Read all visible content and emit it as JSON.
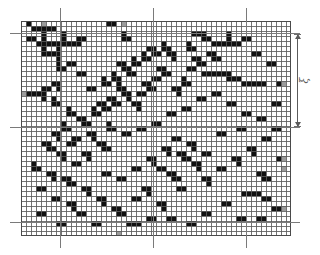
{
  "figure": {
    "type": "percolation-lattice-diagram",
    "background_color": "#ffffff"
  },
  "lattice": {
    "origin_x": 21,
    "origin_y": 21,
    "cell_size": 5,
    "cols": 54,
    "rows": 43,
    "gridline_color": "#5c5c5c",
    "gridline_width": 0.5,
    "occupied_color": "#111111",
    "grey_color": "#9b9b9b",
    "empty_color": "#ffffff",
    "border_color": "#4a4a4a",
    "occupied_cells": [
      [
        2,
        1
      ],
      [
        3,
        1
      ],
      [
        4,
        1
      ],
      [
        5,
        1
      ],
      [
        6,
        1
      ],
      [
        4,
        2
      ],
      [
        4,
        3
      ],
      [
        3,
        4
      ],
      [
        4,
        4
      ],
      [
        5,
        4
      ],
      [
        6,
        4
      ],
      [
        7,
        4
      ],
      [
        8,
        4
      ],
      [
        9,
        4
      ],
      [
        10,
        4
      ],
      [
        11,
        4
      ],
      [
        8,
        2
      ],
      [
        8,
        3
      ],
      [
        11,
        3
      ],
      [
        12,
        3
      ],
      [
        1,
        3
      ],
      [
        2,
        3
      ],
      [
        4,
        5
      ],
      [
        4,
        6
      ],
      [
        5,
        6
      ],
      [
        6,
        6
      ],
      [
        7,
        6
      ],
      [
        7,
        5
      ],
      [
        7,
        7
      ],
      [
        7,
        8
      ],
      [
        7,
        9
      ],
      [
        8,
        9
      ],
      [
        20,
        2
      ],
      [
        20,
        3
      ],
      [
        21,
        3
      ],
      [
        17,
        0
      ],
      [
        18,
        0
      ],
      [
        1,
        0
      ],
      [
        25,
        5
      ],
      [
        26,
        5
      ],
      [
        26,
        6
      ],
      [
        27,
        6
      ],
      [
        24,
        6
      ],
      [
        24,
        7
      ],
      [
        25,
        7
      ],
      [
        22,
        7
      ],
      [
        22,
        8
      ],
      [
        23,
        8
      ],
      [
        19,
        8
      ],
      [
        20,
        8
      ],
      [
        20,
        9
      ],
      [
        21,
        9
      ],
      [
        21,
        10
      ],
      [
        22,
        10
      ],
      [
        18,
        10
      ],
      [
        18,
        11
      ],
      [
        19,
        11
      ],
      [
        16,
        11
      ],
      [
        16,
        12
      ],
      [
        17,
        12
      ],
      [
        19,
        12
      ],
      [
        19,
        13
      ],
      [
        20,
        13
      ],
      [
        20,
        14
      ],
      [
        21,
        14
      ],
      [
        21,
        15
      ],
      [
        17,
        15
      ],
      [
        18,
        15
      ],
      [
        18,
        16
      ],
      [
        19,
        16
      ],
      [
        15,
        16
      ],
      [
        16,
        16
      ],
      [
        16,
        17
      ],
      [
        17,
        17
      ],
      [
        14,
        17
      ],
      [
        14,
        18
      ],
      [
        15,
        18
      ],
      [
        28,
        4
      ],
      [
        28,
        5
      ],
      [
        29,
        5
      ],
      [
        29,
        6
      ],
      [
        30,
        6
      ],
      [
        30,
        7
      ],
      [
        27,
        9
      ],
      [
        28,
        9
      ],
      [
        28,
        10
      ],
      [
        29,
        10
      ],
      [
        26,
        11
      ],
      [
        27,
        11
      ],
      [
        24,
        12
      ],
      [
        25,
        12
      ],
      [
        25,
        13
      ],
      [
        26,
        13
      ],
      [
        23,
        14
      ],
      [
        24,
        14
      ],
      [
        22,
        16
      ],
      [
        23,
        16
      ],
      [
        23,
        17
      ],
      [
        34,
        2
      ],
      [
        35,
        2
      ],
      [
        36,
        2
      ],
      [
        36,
        3
      ],
      [
        37,
        3
      ],
      [
        33,
        4
      ],
      [
        33,
        5
      ],
      [
        34,
        5
      ],
      [
        38,
        4
      ],
      [
        39,
        4
      ],
      [
        40,
        4
      ],
      [
        41,
        4
      ],
      [
        42,
        4
      ],
      [
        43,
        4
      ],
      [
        41,
        2
      ],
      [
        41,
        3
      ],
      [
        44,
        3
      ],
      [
        45,
        3
      ],
      [
        37,
        6
      ],
      [
        38,
        6
      ],
      [
        38,
        7
      ],
      [
        39,
        7
      ],
      [
        34,
        7
      ],
      [
        35,
        7
      ],
      [
        35,
        8
      ],
      [
        36,
        8
      ],
      [
        33,
        9
      ],
      [
        34,
        9
      ],
      [
        36,
        10
      ],
      [
        37,
        10
      ],
      [
        38,
        10
      ],
      [
        39,
        10
      ],
      [
        40,
        10
      ],
      [
        41,
        10
      ],
      [
        41,
        11
      ],
      [
        42,
        11
      ],
      [
        43,
        11
      ],
      [
        44,
        12
      ],
      [
        45,
        12
      ],
      [
        46,
        12
      ],
      [
        47,
        12
      ],
      [
        48,
        12
      ],
      [
        32,
        11
      ],
      [
        32,
        12
      ],
      [
        33,
        12
      ],
      [
        30,
        13
      ],
      [
        31,
        13
      ],
      [
        31,
        14
      ],
      [
        6,
        12
      ],
      [
        7,
        12
      ],
      [
        7,
        13
      ],
      [
        4,
        13
      ],
      [
        5,
        13
      ],
      [
        1,
        14
      ],
      [
        2,
        14
      ],
      [
        3,
        14
      ],
      [
        4,
        14
      ],
      [
        4,
        15
      ],
      [
        6,
        15
      ],
      [
        6,
        16
      ],
      [
        7,
        16
      ],
      [
        9,
        17
      ],
      [
        9,
        18
      ],
      [
        10,
        18
      ],
      [
        11,
        19
      ],
      [
        12,
        19
      ],
      [
        12,
        20
      ],
      [
        13,
        20
      ],
      [
        8,
        20
      ],
      [
        8,
        21
      ],
      [
        9,
        21
      ],
      [
        6,
        22
      ],
      [
        7,
        22
      ],
      [
        7,
        23
      ],
      [
        4,
        24
      ],
      [
        5,
        24
      ],
      [
        5,
        25
      ],
      [
        6,
        25
      ],
      [
        7,
        26
      ],
      [
        8,
        26
      ],
      [
        8,
        27
      ],
      [
        9,
        24
      ],
      [
        10,
        24
      ],
      [
        10,
        23
      ],
      [
        11,
        23
      ],
      [
        13,
        22
      ],
      [
        14,
        22
      ],
      [
        14,
        23
      ],
      [
        15,
        24
      ],
      [
        16,
        24
      ],
      [
        16,
        25
      ],
      [
        17,
        25
      ],
      [
        12,
        26
      ],
      [
        13,
        26
      ],
      [
        13,
        27
      ],
      [
        10,
        28
      ],
      [
        11,
        28
      ],
      [
        2,
        28
      ],
      [
        2,
        29
      ],
      [
        3,
        29
      ],
      [
        5,
        30
      ],
      [
        6,
        30
      ],
      [
        6,
        31
      ],
      [
        8,
        31
      ],
      [
        9,
        31
      ],
      [
        9,
        32
      ],
      [
        10,
        32
      ],
      [
        12,
        33
      ],
      [
        13,
        33
      ],
      [
        13,
        34
      ],
      [
        15,
        35
      ],
      [
        16,
        35
      ],
      [
        16,
        36
      ],
      [
        18,
        37
      ],
      [
        19,
        37
      ],
      [
        19,
        38
      ],
      [
        20,
        38
      ],
      [
        9,
        36
      ],
      [
        10,
        36
      ],
      [
        10,
        37
      ],
      [
        6,
        35
      ],
      [
        7,
        35
      ],
      [
        3,
        33
      ],
      [
        4,
        33
      ],
      [
        24,
        33
      ],
      [
        25,
        33
      ],
      [
        25,
        34
      ],
      [
        22,
        35
      ],
      [
        23,
        35
      ],
      [
        27,
        36
      ],
      [
        28,
        36
      ],
      [
        28,
        37
      ],
      [
        31,
        33
      ],
      [
        32,
        33
      ],
      [
        29,
        30
      ],
      [
        30,
        30
      ],
      [
        30,
        31
      ],
      [
        31,
        31
      ],
      [
        27,
        29
      ],
      [
        28,
        29
      ],
      [
        25,
        27
      ],
      [
        26,
        27
      ],
      [
        26,
        28
      ],
      [
        28,
        25
      ],
      [
        29,
        25
      ],
      [
        29,
        26
      ],
      [
        31,
        26
      ],
      [
        32,
        26
      ],
      [
        32,
        27
      ],
      [
        33,
        27
      ],
      [
        34,
        28
      ],
      [
        35,
        28
      ],
      [
        35,
        29
      ],
      [
        36,
        26
      ],
      [
        37,
        26
      ],
      [
        33,
        24
      ],
      [
        34,
        24
      ],
      [
        34,
        25
      ],
      [
        30,
        23
      ],
      [
        31,
        23
      ],
      [
        36,
        31
      ],
      [
        37,
        31
      ],
      [
        37,
        32
      ],
      [
        39,
        29
      ],
      [
        40,
        29
      ],
      [
        42,
        27
      ],
      [
        43,
        27
      ],
      [
        43,
        28
      ],
      [
        45,
        25
      ],
      [
        46,
        25
      ],
      [
        46,
        26
      ],
      [
        48,
        23
      ],
      [
        49,
        23
      ],
      [
        47,
        30
      ],
      [
        48,
        30
      ],
      [
        48,
        31
      ],
      [
        49,
        31
      ],
      [
        44,
        34
      ],
      [
        45,
        34
      ],
      [
        46,
        34
      ],
      [
        47,
        34
      ],
      [
        48,
        35
      ],
      [
        49,
        35
      ],
      [
        40,
        36
      ],
      [
        41,
        36
      ],
      [
        36,
        38
      ],
      [
        37,
        38
      ],
      [
        21,
        40
      ],
      [
        22,
        40
      ],
      [
        23,
        40
      ],
      [
        25,
        39
      ],
      [
        26,
        39
      ],
      [
        14,
        40
      ],
      [
        15,
        40
      ],
      [
        11,
        38
      ],
      [
        12,
        38
      ],
      [
        17,
        20
      ],
      [
        17,
        21
      ],
      [
        18,
        21
      ],
      [
        20,
        22
      ],
      [
        21,
        22
      ],
      [
        23,
        21
      ],
      [
        24,
        21
      ],
      [
        26,
        20
      ],
      [
        27,
        20
      ],
      [
        29,
        18
      ],
      [
        30,
        18
      ],
      [
        32,
        17
      ],
      [
        33,
        17
      ],
      [
        35,
        15
      ],
      [
        36,
        15
      ],
      [
        38,
        14
      ],
      [
        39,
        14
      ],
      [
        41,
        16
      ],
      [
        42,
        16
      ],
      [
        44,
        18
      ],
      [
        45,
        18
      ],
      [
        47,
        19
      ],
      [
        48,
        19
      ],
      [
        50,
        21
      ],
      [
        51,
        21
      ],
      [
        50,
        16
      ],
      [
        51,
        16
      ],
      [
        49,
        8
      ],
      [
        50,
        8
      ],
      [
        46,
        6
      ],
      [
        47,
        6
      ],
      [
        43,
        21
      ],
      [
        44,
        21
      ],
      [
        39,
        22
      ],
      [
        40,
        22
      ],
      [
        16,
        30
      ],
      [
        17,
        30
      ],
      [
        19,
        31
      ],
      [
        20,
        31
      ],
      [
        22,
        29
      ],
      [
        23,
        29
      ],
      [
        13,
        13
      ],
      [
        14,
        13
      ],
      [
        11,
        10
      ],
      [
        12,
        10
      ],
      [
        9,
        8
      ],
      [
        10,
        8
      ],
      [
        29,
        39
      ],
      [
        30,
        39
      ],
      [
        33,
        40
      ],
      [
        34,
        40
      ],
      [
        7,
        40
      ],
      [
        8,
        40
      ],
      [
        3,
        38
      ],
      [
        4,
        38
      ],
      [
        43,
        39
      ],
      [
        44,
        39
      ],
      [
        47,
        39
      ],
      [
        48,
        39
      ],
      [
        50,
        37
      ],
      [
        51,
        37
      ],
      [
        51,
        12
      ],
      [
        52,
        12
      ],
      [
        51,
        27
      ],
      [
        52,
        27
      ]
    ],
    "grey_cells": [
      [
        4,
        0
      ],
      [
        20,
        0
      ],
      [
        0,
        14
      ],
      [
        52,
        12
      ],
      [
        52,
        27
      ],
      [
        52,
        29
      ],
      [
        52,
        37
      ],
      [
        19,
        42
      ]
    ]
  },
  "crosshairs": {
    "color": "#7a7a7a",
    "vertical": [
      {
        "x": 60,
        "y_top": 8,
        "y_bottom": 248
      },
      {
        "x": 153,
        "y_top": 8,
        "y_bottom": 248
      },
      {
        "x": 246,
        "y_top": 8,
        "y_bottom": 248
      }
    ],
    "horizontal": [
      {
        "y": 33,
        "x_left": 10,
        "x_right": 300
      },
      {
        "y": 127,
        "x_left": 10,
        "x_right": 300
      },
      {
        "y": 222,
        "x_left": 10,
        "x_right": 300
      }
    ]
  },
  "annotation": {
    "label": "ξ",
    "label_name": "xi-correlation-length",
    "arrow": {
      "x": 297,
      "y_top": 34,
      "y_bottom": 127,
      "color": "#5a5a5a",
      "double_headed": true
    }
  }
}
